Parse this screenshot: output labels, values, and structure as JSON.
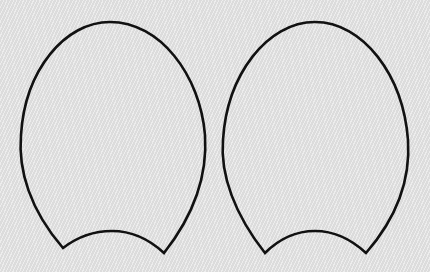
{
  "scene": {
    "description": "Two identical egg-shaped outlines with concave arc bottoms on textured light gray background",
    "background_color": "#e3e3e3",
    "stroke_color": "#111111",
    "shapes": [
      {
        "name": "left-shape",
        "top": [
          108,
          22
        ],
        "left_x": 20,
        "right_x": 205,
        "bottom_left": [
          63,
          248
        ],
        "bottom_right": [
          164,
          253
        ],
        "arc_peak": [
          112,
          231
        ]
      },
      {
        "name": "right-shape",
        "top": [
          315,
          22
        ],
        "left_x": 223,
        "right_x": 408,
        "bottom_left": [
          265,
          253
        ],
        "bottom_right": [
          366,
          253
        ],
        "arc_peak": [
          315,
          231
        ]
      }
    ]
  }
}
